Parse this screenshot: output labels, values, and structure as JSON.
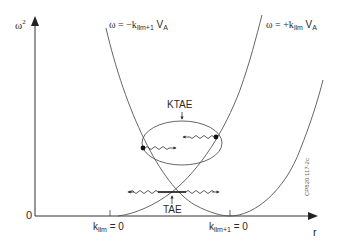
{
  "diagram": {
    "axes": {
      "y_label_base": "ω",
      "y_label_sup": "2",
      "x_label": "r",
      "origin_label": "0"
    },
    "curves": {
      "left_branch_label": {
        "prefix": "ω = −k",
        "sub": "llm+1",
        "suffix": " V",
        "suffix_sub": "A"
      },
      "right_branch_label": {
        "prefix": "ω = +k",
        "sub": "llm",
        "suffix": " V",
        "suffix_sub": "A"
      }
    },
    "ticks": {
      "first": {
        "prefix": "k",
        "sub": "llm",
        "suffix": " = 0"
      },
      "second": {
        "prefix": "k",
        "sub": "llm+1",
        "suffix": " = 0"
      }
    },
    "annotations": {
      "ktae": "KTAE",
      "tae": "TAE"
    },
    "figure_id": "CP820.117-2c",
    "colors": {
      "line": "#555555",
      "axis": "#333333",
      "text": "#2a2a2a"
    }
  }
}
